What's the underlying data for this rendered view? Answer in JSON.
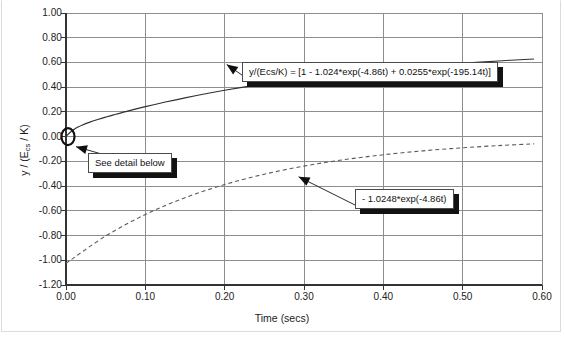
{
  "chart_data": {
    "type": "line",
    "title": "",
    "xlabel": "Time (secs)",
    "ylabel": "y / (Ecs / K)",
    "xlim": [
      0.0,
      0.6
    ],
    "ylim": [
      -1.2,
      1.0
    ],
    "grid": true,
    "legend_position": "none",
    "xticks": [
      "0.00",
      "0.10",
      "0.20",
      "0.30",
      "0.40",
      "0.50",
      "0.60"
    ],
    "xtick_values": [
      0.0,
      0.1,
      0.2,
      0.3,
      0.4,
      0.5,
      0.6
    ],
    "yticks": [
      "1.00",
      "0.80",
      "0.60",
      "0.40",
      "0.20",
      "0.00",
      "-0.20",
      "-0.40",
      "-0.60",
      "-0.80",
      "-1.00",
      "-1.20"
    ],
    "ytick_values": [
      1.0,
      0.8,
      0.6,
      0.4,
      0.2,
      0.0,
      -0.2,
      -0.4,
      -0.6,
      -0.8,
      -1.0,
      -1.2
    ],
    "series": [
      {
        "name": "y/(Ecs/K) = [1 - 1.024*exp(-4.86t) + 0.0255*exp(-195.14t)]",
        "style": "solid",
        "color": "#303030",
        "x": [
          0.0,
          0.005,
          0.01,
          0.015,
          0.02,
          0.03,
          0.04,
          0.05,
          0.06,
          0.08,
          0.1,
          0.12,
          0.15,
          0.2,
          0.25,
          0.3,
          0.35,
          0.4,
          0.45,
          0.5,
          0.55,
          0.59
        ],
        "values": [
          0.0015,
          0.0337,
          0.0582,
          0.0773,
          0.0926,
          0.1174,
          0.1384,
          0.1579,
          0.1762,
          0.2106,
          0.2425,
          0.2722,
          0.3136,
          0.3747,
          0.4269,
          0.4713,
          0.5093,
          0.5418,
          0.5696,
          0.5934,
          0.6138,
          0.6278
        ]
      },
      {
        "name": "- 1.0248*exp(-4.86t)",
        "style": "dashed",
        "color": "#5a5a5a",
        "x": [
          0.0,
          0.05,
          0.1,
          0.15,
          0.2,
          0.25,
          0.3,
          0.35,
          0.4,
          0.45,
          0.5,
          0.55,
          0.59
        ],
        "values": [
          -1.0248,
          -0.8036,
          -0.6302,
          -0.4942,
          -0.3876,
          -0.3039,
          -0.2383,
          -0.1869,
          -0.1466,
          -0.1149,
          -0.0901,
          -0.0707,
          -0.0585
        ]
      }
    ],
    "markers": [
      {
        "name": "origin-ellipse",
        "x": 0.0,
        "y": 0.0,
        "shape": "ellipse"
      }
    ],
    "annotations": [
      {
        "id": "equation-full",
        "text": "y/(Ecs/K)  =  [1  -  1.024*exp(-4.86t)  +  0.0255*exp(-195.14t)]",
        "points_to": {
          "x": 0.2,
          "y": 0.6
        }
      },
      {
        "id": "equation-term",
        "text": "-  1.0248*exp(-4.86t)",
        "points_to": {
          "x": 0.3,
          "y": -0.34
        }
      },
      {
        "id": "see-detail",
        "text": "See  detail  below",
        "points_to": {
          "x": 0.0,
          "y": 0.0
        }
      }
    ]
  },
  "axes": {
    "x_title": "Time (secs)",
    "y_title_main": "y / (E",
    "y_title_sub": "cs",
    "y_title_tail": " / K)"
  }
}
